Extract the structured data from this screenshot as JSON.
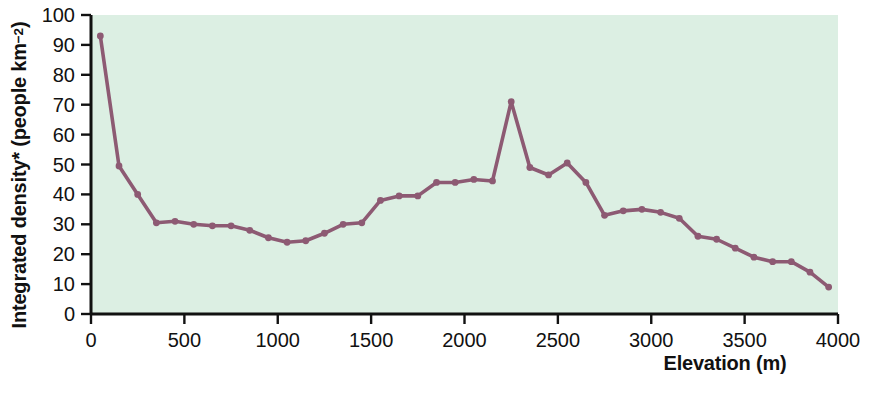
{
  "chart_data": {
    "type": "line",
    "title": "",
    "xlabel": "Elevation (m)",
    "ylabel": "Integrated density* (people km−2)",
    "ylabel_main": "Integrated density* (people km",
    "ylabel_sup": "−2",
    "ylabel_close": ")",
    "xlim": [
      0,
      4000
    ],
    "ylim": [
      0,
      100
    ],
    "xticks": [
      0,
      500,
      1000,
      1500,
      2000,
      2500,
      3000,
      3500,
      4000
    ],
    "xticklabels": [
      "0",
      "500",
      "1000",
      "1500",
      "2000",
      "2500",
      "3000",
      "3500",
      "4000"
    ],
    "yticks": [
      0,
      10,
      20,
      30,
      40,
      50,
      60,
      70,
      80,
      90,
      100
    ],
    "yticklabels": [
      "0",
      "10",
      "20",
      "30",
      "40",
      "50",
      "60",
      "70",
      "80",
      "90",
      "100"
    ],
    "grid": false,
    "legend": false,
    "plot_background_color": "#dcefe3",
    "line_color": "#8d5a73",
    "marker_color": "#8d5a73",
    "axis_color": "#111111",
    "marker": "circle",
    "x": [
      50,
      150,
      250,
      350,
      450,
      550,
      650,
      750,
      850,
      950,
      1050,
      1150,
      1250,
      1350,
      1450,
      1550,
      1650,
      1750,
      1850,
      1950,
      2050,
      2150,
      2250,
      2350,
      2450,
      2550,
      2650,
      2750,
      2850,
      2950,
      3050,
      3150,
      3250,
      3350,
      3450,
      3550,
      3650,
      3750,
      3850,
      3950
    ],
    "y": [
      93,
      49.5,
      40,
      30.5,
      31,
      30,
      29.5,
      29.5,
      28,
      25.5,
      24,
      24.5,
      27,
      30,
      30.5,
      38,
      39.5,
      39.5,
      44,
      44,
      45,
      44.5,
      71,
      49,
      46.5,
      50.5,
      44,
      33,
      34.5,
      35,
      34,
      32,
      26,
      25,
      22,
      19,
      17.5,
      17.5,
      14,
      9
    ],
    "series": [
      {
        "name": "Integrated density",
        "x": [
          50,
          150,
          250,
          350,
          450,
          550,
          650,
          750,
          850,
          950,
          1050,
          1150,
          1250,
          1350,
          1450,
          1550,
          1650,
          1750,
          1850,
          1950,
          2050,
          2150,
          2250,
          2350,
          2450,
          2550,
          2650,
          2750,
          2850,
          2950,
          3050,
          3150,
          3250,
          3350,
          3450,
          3550,
          3650,
          3750,
          3850,
          3950
        ],
        "values": [
          93,
          49.5,
          40,
          30.5,
          31,
          30,
          29.5,
          29.5,
          28,
          25.5,
          24,
          24.5,
          27,
          30,
          30.5,
          38,
          39.5,
          39.5,
          44,
          44,
          45,
          44.5,
          71,
          49,
          46.5,
          50.5,
          44,
          33,
          34.5,
          35,
          34,
          32,
          26,
          25,
          22,
          19,
          17.5,
          17.5,
          14,
          9
        ]
      }
    ],
    "annotations": []
  }
}
